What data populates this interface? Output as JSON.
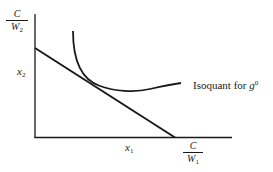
{
  "diagram": {
    "type": "isoquant-cost-line",
    "axes": {
      "y_axis_top_label": {
        "numerator": "C",
        "denominator_var": "W",
        "denominator_sub": "2"
      },
      "y_axis_marker": {
        "var": "x",
        "sub": "2"
      },
      "x_axis_marker": {
        "var": "x",
        "sub": "1"
      },
      "x_axis_end_label": {
        "numerator": "C",
        "denominator_var": "W",
        "denominator_sub": "1"
      }
    },
    "curves": [
      {
        "name": "isocost-line",
        "label": ""
      },
      {
        "name": "isoquant",
        "label_text": "Isoquant for ",
        "label_var": "g",
        "label_sup": "0"
      }
    ],
    "colors": {
      "line": "#1a1a1a",
      "background": "#ffffff"
    }
  }
}
